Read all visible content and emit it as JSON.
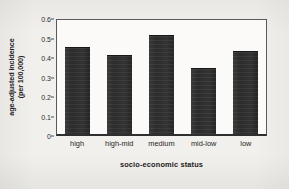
{
  "chart_data": {
    "type": "bar",
    "title": "",
    "subtitle": "",
    "xlabel": "socio-economic status",
    "ylabel_line1": "age-adjusted incidence",
    "ylabel_line2": "(per 100,000)",
    "ylabel": "age-adjusted incidence (per 100,000)",
    "categories": [
      "high",
      "high-mid",
      "medium",
      "mid-low",
      "low"
    ],
    "values": [
      0.445,
      0.405,
      0.51,
      0.34,
      0.425
    ],
    "ylim": [
      0,
      0.6
    ],
    "ytick_labels": [
      "0.6",
      "0.5",
      "0.4",
      "0.3",
      "0.2",
      "0.1",
      "0"
    ],
    "ytick_values": [
      0.6,
      0.5,
      0.4,
      0.3,
      0.2,
      0.1,
      0
    ],
    "grid": false,
    "legend": false,
    "legend_position": "none",
    "annotations": [],
    "bar_color": "#2e2e2e",
    "plot_background": "#fbfaf8",
    "page_background": "#f1f0ed",
    "axis_color": "#2f2f2f"
  }
}
